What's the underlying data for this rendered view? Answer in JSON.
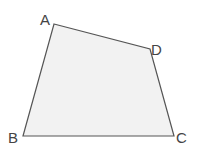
{
  "figure": {
    "type": "quadrilateral",
    "fill_color": "#f2f2f2",
    "stroke_color": "#555555",
    "vertices": [
      {
        "label": "A"
      },
      {
        "label": "D"
      },
      {
        "label": "C"
      },
      {
        "label": "B"
      }
    ]
  }
}
